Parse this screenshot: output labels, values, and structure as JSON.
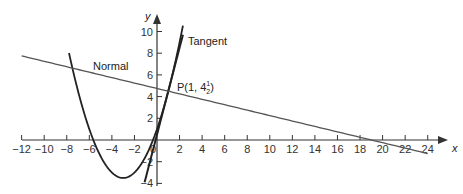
{
  "chart_data": {
    "type": "line",
    "title": "",
    "xlabel": "x",
    "ylabel": "y",
    "xlim": [
      -12,
      24.5
    ],
    "ylim": [
      -4,
      11
    ],
    "grid": false,
    "x_ticks": [
      -12,
      -10,
      -8,
      -6,
      -4,
      -2,
      0,
      2,
      4,
      6,
      8,
      10,
      12,
      14,
      16,
      18,
      20,
      22,
      24
    ],
    "x_tick_labels": [
      "−12",
      "−10",
      "−8",
      "−6",
      "−4",
      "−2",
      "0",
      "2",
      "4",
      "6",
      "8",
      "10",
      "12",
      "14",
      "16",
      "18",
      "20",
      "22",
      "24"
    ],
    "y_ticks": [
      -4,
      -2,
      2,
      4,
      6,
      8,
      10
    ],
    "y_tick_labels": [
      "−4",
      "−2",
      "2",
      "4",
      "6",
      "8",
      "10"
    ],
    "series": [
      {
        "name": "Curve",
        "kind": "parabola",
        "equation": "y = 0.5x^2 + 3x + 1",
        "x_range": [
          -7.8,
          2.3
        ],
        "color": "#222222"
      },
      {
        "name": "Tangent",
        "kind": "line",
        "equation": "y = 4x + 0.5",
        "x_range": [
          -1.1,
          2.3
        ],
        "color": "#222222"
      },
      {
        "name": "Normal",
        "kind": "line",
        "equation": "y = -0.25x + 4.75",
        "x_range": [
          -12,
          24
        ],
        "color": "#555555"
      }
    ],
    "annotations": [
      {
        "text": "Tangent",
        "x": 2.6,
        "y": 9.3
      },
      {
        "text": "Normal",
        "x": -5.8,
        "y": 6.0
      },
      {
        "text": "P(1, 4½)",
        "point": [
          1,
          4.5
        ]
      }
    ]
  },
  "labels": {
    "tangent": "Tangent",
    "normal": "Normal",
    "point_prefix": "P(1, 4",
    "point_frac_num": "1",
    "point_frac_den": "2",
    "point_suffix": ")",
    "x_axis": "x",
    "y_axis": "y"
  }
}
